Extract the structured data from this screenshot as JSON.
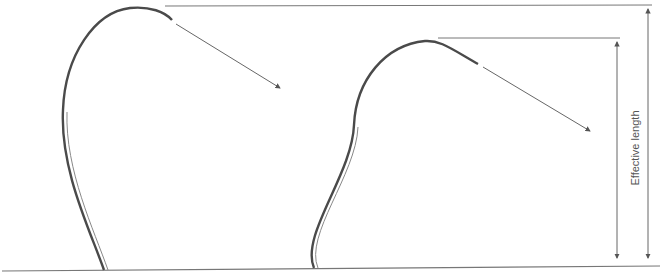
{
  "diagram": {
    "title": "",
    "label_effective_length": "Effective length",
    "colors": {
      "stroke": "#555555",
      "shape_stroke": "#4a4a4a",
      "ground": "#777777",
      "text": "#555555"
    },
    "elements": [
      {
        "id": "left-bent-shape",
        "type": "curved-stem"
      },
      {
        "id": "left-direction-arrow",
        "type": "arrow"
      },
      {
        "id": "right-bent-shape",
        "type": "curved-stem"
      },
      {
        "id": "right-direction-arrow",
        "type": "arrow"
      },
      {
        "id": "top-reference-line",
        "type": "line"
      },
      {
        "id": "inner-reference-line",
        "type": "line"
      },
      {
        "id": "outer-dimension-arrow",
        "type": "double-arrow"
      },
      {
        "id": "inner-dimension-arrow",
        "type": "double-arrow"
      },
      {
        "id": "ground-line",
        "type": "line"
      }
    ]
  }
}
